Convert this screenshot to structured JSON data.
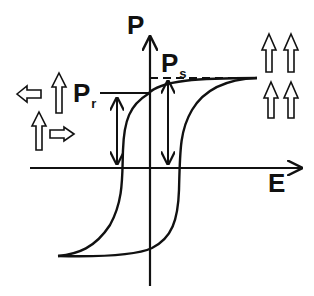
{
  "diagram": {
    "type": "ferroelectric-hysteresis-loop",
    "axes": {
      "vertical_label": "P",
      "horizontal_label": "E"
    },
    "annotations": {
      "remanent": {
        "main": "P",
        "sub": "r"
      },
      "saturation": {
        "main": "P",
        "sub": "s"
      }
    },
    "domain_arrows": {
      "left_cluster": [
        "left",
        "up",
        "up",
        "right"
      ],
      "right_cluster": [
        "up",
        "up",
        "up",
        "up"
      ]
    },
    "colors": {
      "stroke": "#111111",
      "background": "#ffffff"
    }
  }
}
